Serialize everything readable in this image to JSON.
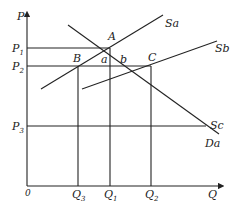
{
  "diagram": {
    "type": "supply-demand",
    "axes": {
      "y_label": "P",
      "x_label": "Q",
      "origin_label": "0"
    },
    "price_levels": [
      {
        "id": "P1",
        "base": "P",
        "sub": "1"
      },
      {
        "id": "P2",
        "base": "P",
        "sub": "2"
      },
      {
        "id": "P3",
        "base": "P",
        "sub": "3"
      }
    ],
    "quantity_levels": [
      {
        "id": "Q3",
        "base": "Q",
        "sub": "3"
      },
      {
        "id": "Q1",
        "base": "Q",
        "sub": "1"
      },
      {
        "id": "Q2",
        "base": "Q",
        "sub": "2"
      }
    ],
    "curves": [
      {
        "id": "Sa",
        "label": "Sa",
        "kind": "supply"
      },
      {
        "id": "Sb",
        "label": "Sb",
        "kind": "supply"
      },
      {
        "id": "Sc",
        "label": "Sc",
        "kind": "supply-horizontal"
      },
      {
        "id": "Da",
        "label": "Da",
        "kind": "demand"
      }
    ],
    "points": [
      {
        "id": "A",
        "label": "A",
        "at": "P1,Q1"
      },
      {
        "id": "B",
        "label": "B",
        "at": "P2,Q3"
      },
      {
        "id": "C",
        "label": "C",
        "at": "P2,Q2"
      }
    ],
    "regions": [
      {
        "id": "a",
        "label": "a"
      },
      {
        "id": "b",
        "label": "b"
      }
    ]
  }
}
